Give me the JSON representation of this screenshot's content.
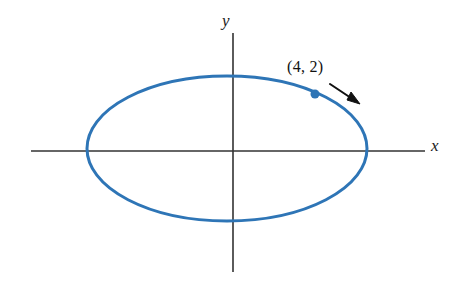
{
  "figure": {
    "title": "",
    "background_color": "#ffffff",
    "width": 459,
    "height": 284
  },
  "axes": {
    "x_label": "x",
    "y_label": "y",
    "axis_color": "#333333",
    "x_axis": {
      "y_px": 151,
      "x_start_px": 31,
      "x_end_px": 425
    },
    "y_axis": {
      "x_px": 233,
      "y_start_px": 33,
      "y_end_px": 272
    },
    "origin_px": {
      "x": 233,
      "y": 151
    }
  },
  "annotations": {
    "point_label": "(4, 2)",
    "arrow_name": "pointer-arrow",
    "arrow_color": "#111111"
  },
  "chart_data": {
    "type": "line",
    "title": "",
    "xlabel": "x",
    "ylabel": "y",
    "grid": false,
    "legend": null,
    "curve": {
      "name": "ellipse",
      "equation": "(x^2)/25 + (y^2)/9 = 1",
      "shape": "ellipse",
      "center": [
        0,
        0
      ],
      "semi_axis_x": 5,
      "semi_axis_y": 3,
      "color": "#2E75B6",
      "stroke_width": 3,
      "center_px": [
        227,
        148.5
      ],
      "radius_x_px": 140,
      "radius_y_px": 72.5
    },
    "points": [
      {
        "label": "(4, 2)",
        "x": 4,
        "y": 2,
        "color": "#2E75B6",
        "px": [
          315,
          94
        ],
        "radius_px": 4.5
      }
    ],
    "xlim": [
      -7.2,
      6.9
    ],
    "ylim": [
      -5.1,
      4.9
    ]
  }
}
